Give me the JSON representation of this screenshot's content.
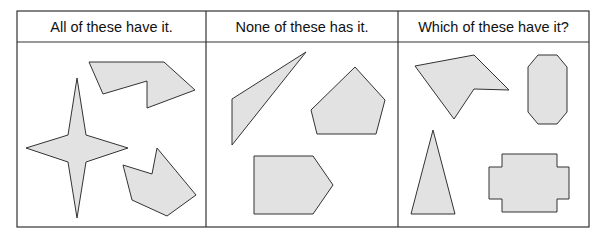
{
  "columns": [
    {
      "header": "All of these have it."
    },
    {
      "header": "None of these has it."
    },
    {
      "header": "Which of these have it?"
    }
  ],
  "colors": {
    "shape_fill": "#e2e2e2",
    "stroke": "#333333"
  },
  "shapes": {
    "panel1": [
      "four-point-star",
      "concave-hexagon-top",
      "concave-hexagon-bottom"
    ],
    "panel2": [
      "obtuse-triangle",
      "pentagon",
      "house-pentagon"
    ],
    "panel3": [
      "concave-pentagon",
      "octagon",
      "isosceles-triangle",
      "cross-dodecagon"
    ]
  }
}
